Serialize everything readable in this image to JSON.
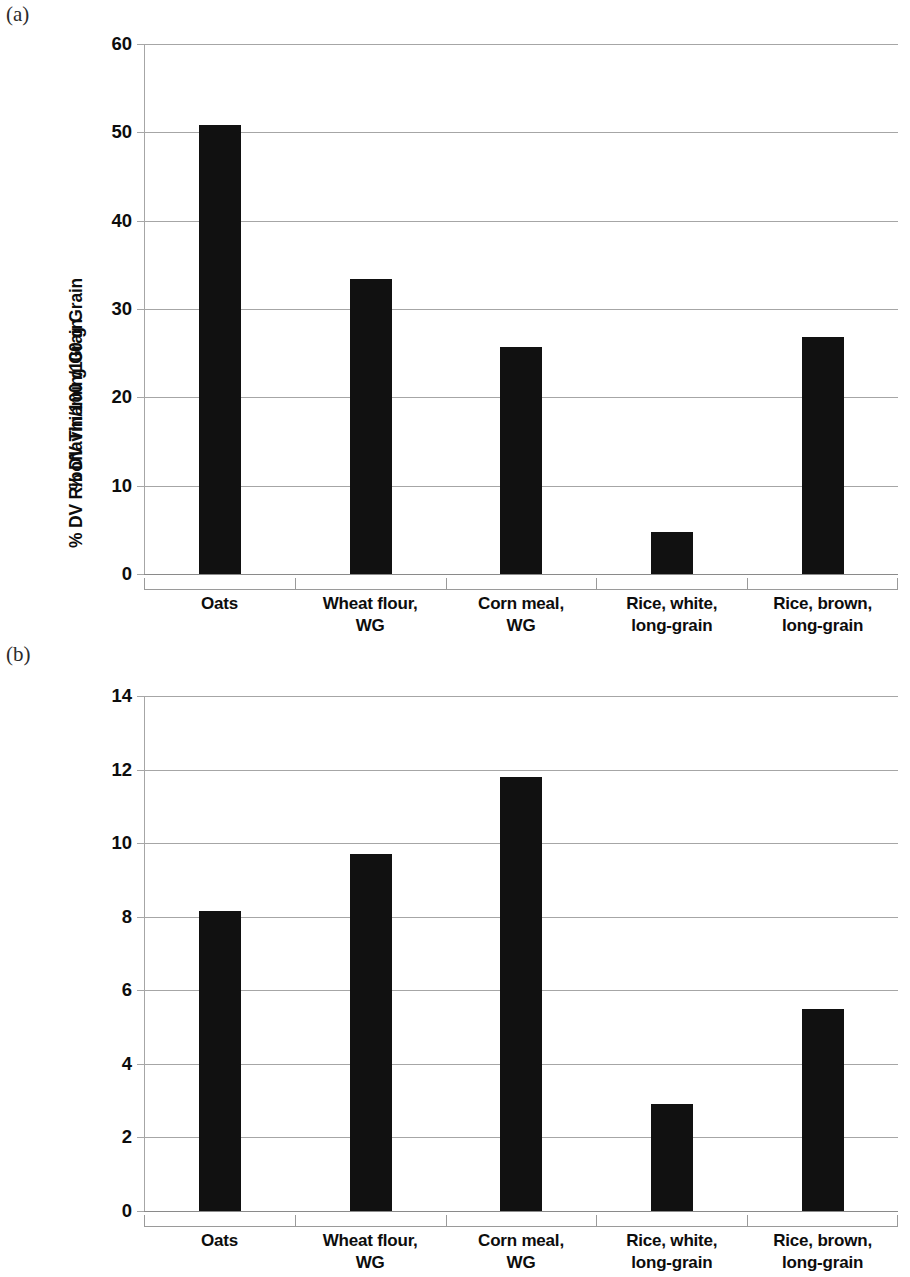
{
  "figure": {
    "panels": [
      {
        "tag": "(a)",
        "ylabel": "% DV Thiamin/100 g Grain",
        "ticks": [
          "60",
          "50",
          "40",
          "30",
          "20",
          "10",
          "0"
        ],
        "categories": [
          [
            "Oats"
          ],
          [
            "Wheat flour,",
            "WG"
          ],
          [
            "Corn meal,",
            "WG"
          ],
          [
            "Rice, white,",
            "long-grain"
          ],
          [
            "Rice, brown,",
            "long-grain"
          ]
        ]
      },
      {
        "tag": "(b)",
        "ylabel": "% DV Riboflavin/100 g Grain",
        "ticks": [
          "14",
          "12",
          "10",
          "8",
          "6",
          "4",
          "2",
          "0"
        ],
        "categories": [
          [
            "Oats"
          ],
          [
            "Wheat flour,",
            "WG"
          ],
          [
            "Corn meal,",
            "WG"
          ],
          [
            "Rice, white,",
            "long-grain"
          ],
          [
            "Rice, brown,",
            "long-grain"
          ]
        ]
      }
    ],
    "bar_color": "#111111",
    "grid_color": "#a6a6a6"
  },
  "chart_data": [
    {
      "type": "bar",
      "panel": "(a)",
      "title": "",
      "xlabel": "",
      "ylabel": "% DV Thiamin/100 g Grain",
      "categories": [
        "Oats",
        "Wheat flour, WG",
        "Corn meal, WG",
        "Rice, white, long-grain",
        "Rice, brown, long-grain"
      ],
      "values": [
        50.8,
        33.4,
        25.7,
        4.7,
        26.8
      ],
      "ylim": [
        0,
        60
      ],
      "ytick_values": [
        0,
        10,
        20,
        30,
        40,
        50,
        60
      ],
      "grid": true,
      "legend": null
    },
    {
      "type": "bar",
      "panel": "(b)",
      "title": "",
      "xlabel": "",
      "ylabel": "% DV Riboflavin/100 g Grain",
      "categories": [
        "Oats",
        "Wheat flour, WG",
        "Corn meal, WG",
        "Rice, white, long-grain",
        "Rice, brown, long-grain"
      ],
      "values": [
        8.15,
        9.7,
        11.8,
        2.9,
        5.5
      ],
      "ylim": [
        0,
        14
      ],
      "ytick_values": [
        0,
        2,
        4,
        6,
        8,
        10,
        12,
        14
      ],
      "grid": true,
      "legend": null
    }
  ]
}
